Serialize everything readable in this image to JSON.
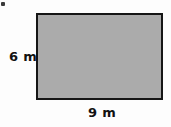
{
  "figure": {
    "kind": "rectangle-with-dimension-labels",
    "background_color": "#fdfdfd",
    "shape": {
      "name": "rectangle",
      "fill_color": "#ababab",
      "border_color": "#161616"
    },
    "labels": {
      "height": "6 m",
      "width": "9 m"
    },
    "artifact": {
      "name": "scan-speck",
      "color": "#3a3a3a"
    }
  },
  "chart_data": {
    "type": "diagram",
    "title": "",
    "shape": "rectangle",
    "dimensions": [
      {
        "side": "height",
        "value": 6,
        "unit": "m",
        "label": "6 m",
        "position": "left"
      },
      {
        "side": "width",
        "value": 9,
        "unit": "m",
        "label": "9 m",
        "position": "bottom"
      }
    ],
    "fill": "#ababab",
    "stroke": "#161616",
    "grid": false,
    "legend": false
  }
}
